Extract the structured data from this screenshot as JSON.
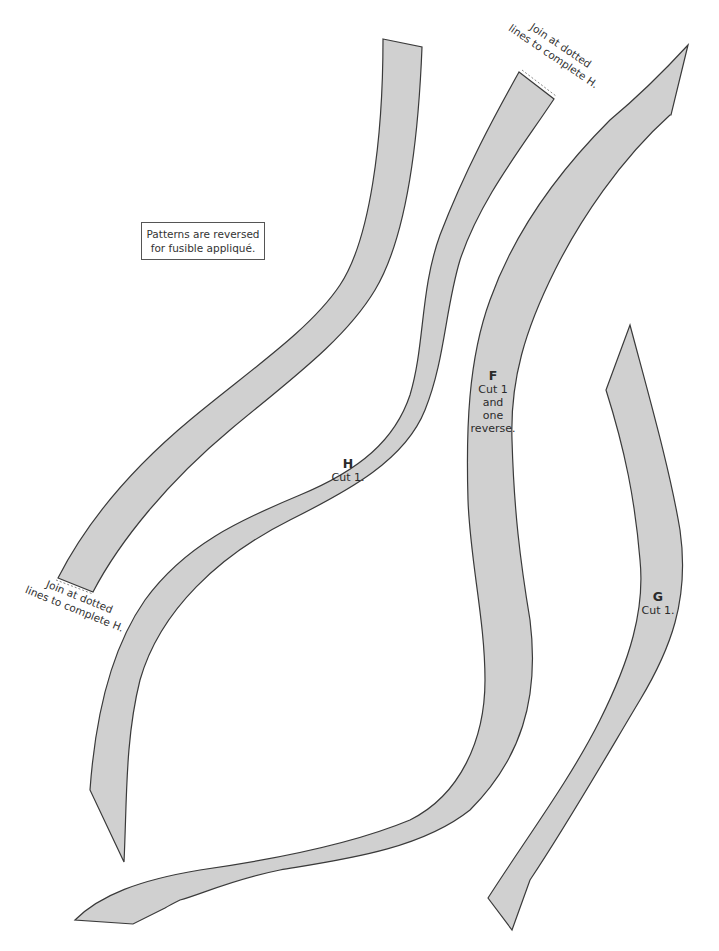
{
  "note": {
    "line1": "Patterns are reversed",
    "line2": "for fusible appliqué."
  },
  "join_labels": [
    {
      "line1": "Join at dotted",
      "line2": "lines to complete H."
    },
    {
      "line1": "Join at dotted",
      "line2": "lines to complete H."
    }
  ],
  "pieces": [
    {
      "letter": "H",
      "instruction": "Cut 1."
    },
    {
      "letter": "F",
      "instruction_lines": [
        "Cut 1",
        "and",
        "one",
        "reverse."
      ]
    },
    {
      "letter": "G",
      "instruction": "Cut 1."
    }
  ],
  "colors": {
    "fill": "#d0d0d0",
    "stroke": "#3a3a3a",
    "background": "#ffffff"
  }
}
